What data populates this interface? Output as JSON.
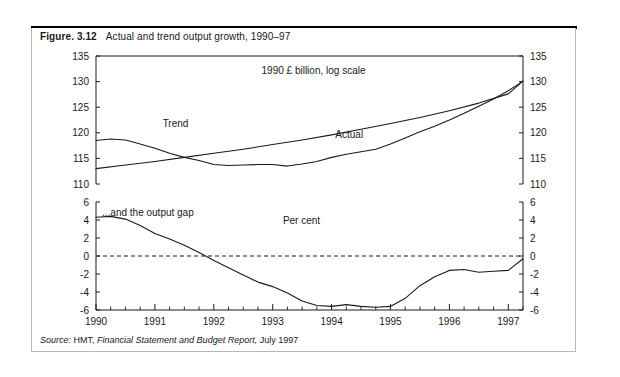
{
  "figure": {
    "label": "Figure. 3.12",
    "caption": "Actual and trend output growth, 1990–97",
    "source_word": "Source:",
    "source_org": "HMT,",
    "source_publication": "Financial Statement and Budget Report,",
    "source_date": "July 1997"
  },
  "colors": {
    "ink": "#1a1a1a",
    "rule": "#000000",
    "box_border": "#b8b8b8",
    "background": "#ffffff"
  },
  "chart_data": {
    "type": "line",
    "title": "Actual and trend output growth, 1990–97",
    "panels": [
      {
        "name": "output-level-panel",
        "annotation": "1990 £ billion, log scale",
        "ylabel": "",
        "ylim": [
          110,
          135
        ],
        "yticks": [
          110,
          115,
          120,
          125,
          130,
          135
        ],
        "right_axis": true,
        "right_yticks": [
          110,
          115,
          120,
          125,
          130,
          135
        ],
        "grid": false,
        "series": [
          {
            "name": "Trend",
            "label_position": "upper-left",
            "x": [
              1990.0,
              1990.5,
              1991.0,
              1991.5,
              1992.0,
              1992.5,
              1993.0,
              1993.5,
              1994.0,
              1994.5,
              1995.0,
              1995.5,
              1996.0,
              1996.5,
              1997.0,
              1997.25
            ],
            "values": [
              113.0,
              113.7,
              114.4,
              115.2,
              116.0,
              116.8,
              117.7,
              118.6,
              119.6,
              120.7,
              121.8,
              123.0,
              124.3,
              125.8,
              127.6,
              130.1
            ]
          },
          {
            "name": "Actual",
            "label_position": "mid-right",
            "x": [
              1990.0,
              1990.25,
              1990.5,
              1990.75,
              1991.0,
              1991.25,
              1991.5,
              1991.75,
              1992.0,
              1992.25,
              1992.5,
              1992.75,
              1993.0,
              1993.25,
              1993.5,
              1993.75,
              1994.0,
              1994.25,
              1994.5,
              1994.75,
              1995.0,
              1995.25,
              1995.5,
              1995.75,
              1996.0,
              1996.25,
              1996.5,
              1996.75,
              1997.0,
              1997.25
            ],
            "values": [
              118.5,
              118.8,
              118.6,
              117.8,
              117.0,
              116.0,
              115.2,
              114.6,
              113.8,
              113.6,
              113.7,
              113.8,
              113.8,
              113.5,
              113.9,
              114.4,
              115.2,
              115.8,
              116.3,
              116.8,
              117.8,
              119.0,
              120.2,
              121.3,
              122.5,
              123.8,
              125.2,
              126.6,
              128.2,
              130.1
            ]
          }
        ]
      },
      {
        "name": "output-gap-panel",
        "annotation_left": "...and the output gap",
        "annotation_center": "Per cent",
        "ylabel": "",
        "ylim": [
          -6,
          6
        ],
        "yticks": [
          -6,
          -4,
          -2,
          0,
          2,
          4,
          6
        ],
        "right_axis": true,
        "right_yticks": [
          -6,
          -4,
          -2,
          0,
          2,
          4,
          6
        ],
        "zero_reference_line": 0,
        "grid": false,
        "series": [
          {
            "name": "Output gap",
            "x": [
              1990.0,
              1990.25,
              1990.5,
              1990.75,
              1991.0,
              1991.25,
              1991.5,
              1991.75,
              1992.0,
              1992.25,
              1992.5,
              1992.75,
              1993.0,
              1993.25,
              1993.5,
              1993.75,
              1994.0,
              1994.25,
              1994.5,
              1994.75,
              1995.0,
              1995.25,
              1995.5,
              1995.75,
              1996.0,
              1996.25,
              1996.5,
              1996.75,
              1997.0,
              1997.25
            ],
            "values": [
              4.3,
              4.4,
              4.1,
              3.4,
              2.5,
              1.9,
              1.2,
              0.4,
              -0.5,
              -1.3,
              -2.1,
              -2.9,
              -3.4,
              -4.1,
              -5.0,
              -5.5,
              -5.6,
              -5.4,
              -5.6,
              -5.7,
              -5.6,
              -4.7,
              -3.3,
              -2.3,
              -1.6,
              -1.5,
              -1.8,
              -1.7,
              -1.6,
              -0.3
            ]
          }
        ]
      }
    ],
    "xlabel": "",
    "xticks": [
      1990,
      1991,
      1992,
      1993,
      1994,
      1995,
      1996,
      1997
    ],
    "xticklabels": [
      "1990",
      "1991",
      "1992",
      "1993",
      "1994",
      "1995",
      "1996",
      "1997"
    ],
    "xlim": [
      1990,
      1997.25
    ],
    "x_minor_tick_interval": 0.25
  }
}
